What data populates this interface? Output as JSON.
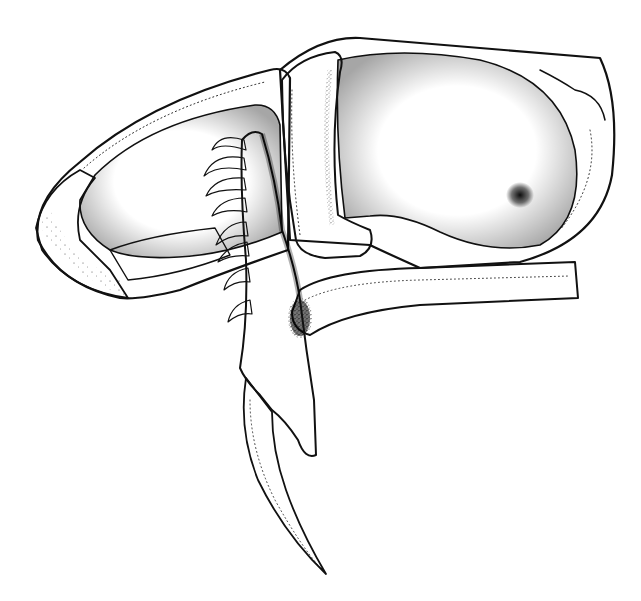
{
  "figure": {
    "description": "Stippled pen-and-ink illustration of a raptorial insect foreleg: coxa/trochanter, enlarged femur with a row of curved spines, tibia bearing a long curved terminal claw, and a tarsal/rod segment extending to the right",
    "style": "black ink stipple on white",
    "colors": {
      "background": "#ffffff",
      "ink": "#111111"
    },
    "parts": [
      {
        "name": "coxa-left-lobe"
      },
      {
        "name": "femur-left-lobe"
      },
      {
        "name": "trochanter-bar"
      },
      {
        "name": "femur-right-lobe"
      },
      {
        "name": "dark-spot"
      },
      {
        "name": "spine-row",
        "count": 8
      },
      {
        "name": "tibia"
      },
      {
        "name": "terminal-claw"
      },
      {
        "name": "tarsal-rod"
      }
    ]
  }
}
